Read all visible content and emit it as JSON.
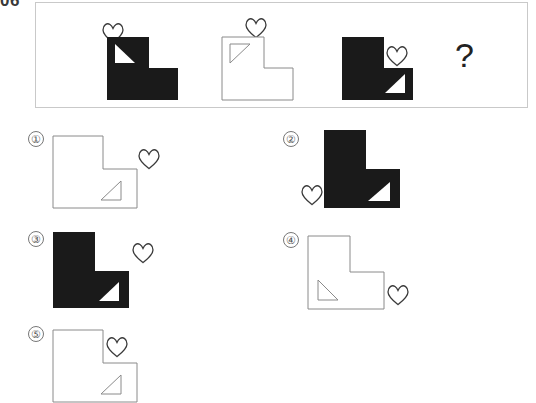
{
  "question": {
    "number": "06",
    "prompt_symbol": "?"
  },
  "colors": {
    "fill_black": "#1a1a1a",
    "fill_white": "#ffffff",
    "outline_gray": "#8a8a8a",
    "panel_border": "#c9c9c9",
    "label_text": "#555555"
  },
  "stem": {
    "cells": [
      {
        "index": 1,
        "shape": "L-shape",
        "shape_fill": "black",
        "triangle": {
          "present": true,
          "fill": "white",
          "position": "upper-left",
          "right_angle_corner": "bottom-left"
        },
        "heart": {
          "present": true,
          "fill": "outline",
          "position": "above-left-outside"
        }
      },
      {
        "index": 2,
        "shape": "L-shape",
        "shape_fill": "white",
        "triangle": {
          "present": true,
          "fill": "outline",
          "position": "upper-left",
          "right_angle_corner": "top-left"
        },
        "heart": {
          "present": true,
          "fill": "outline",
          "position": "above-right-outside"
        }
      },
      {
        "index": 3,
        "shape": "L-shape",
        "shape_fill": "black",
        "triangle": {
          "present": true,
          "fill": "white",
          "position": "lower-right",
          "right_angle_corner": "top-right"
        },
        "heart": {
          "present": true,
          "fill": "outline",
          "position": "middle-right-inside-notch"
        }
      },
      {
        "index": 4,
        "shape": "unknown",
        "shape_fill": "none",
        "triangle": {
          "present": false
        },
        "heart": {
          "present": false
        }
      }
    ]
  },
  "options": [
    {
      "label": "①",
      "shape": "L-shape",
      "shape_fill": "white",
      "triangle": {
        "present": true,
        "fill": "outline",
        "position": "lower-right",
        "right_angle_corner": "bottom-right"
      },
      "heart": {
        "present": true,
        "fill": "outline",
        "position": "middle-right-outside"
      }
    },
    {
      "label": "②",
      "shape": "L-shape",
      "shape_fill": "black",
      "triangle": {
        "present": true,
        "fill": "white",
        "position": "lower-right",
        "right_angle_corner": "top-right"
      },
      "heart": {
        "present": true,
        "fill": "outline",
        "position": "lower-left-outside"
      }
    },
    {
      "label": "③",
      "shape": "L-shape",
      "shape_fill": "black",
      "triangle": {
        "present": true,
        "fill": "white",
        "position": "lower-right",
        "right_angle_corner": "bottom-right"
      },
      "heart": {
        "present": true,
        "fill": "outline",
        "position": "middle-right-outside"
      }
    },
    {
      "label": "④",
      "shape": "L-shape",
      "shape_fill": "white",
      "triangle": {
        "present": true,
        "fill": "outline",
        "position": "lower-left",
        "right_angle_corner": "bottom-left"
      },
      "heart": {
        "present": true,
        "fill": "outline",
        "position": "lower-right-outside"
      }
    },
    {
      "label": "⑤",
      "shape": "L-shape",
      "shape_fill": "white",
      "triangle": {
        "present": true,
        "fill": "outline",
        "position": "lower-right",
        "right_angle_corner": "bottom-right"
      },
      "heart": {
        "present": true,
        "fill": "outline",
        "position": "middle-right-inside-notch"
      },
      "clipped": true
    }
  ]
}
